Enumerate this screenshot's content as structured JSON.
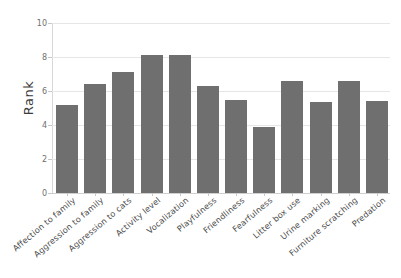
{
  "chart_data": {
    "type": "bar",
    "title": "",
    "xlabel": "",
    "ylabel": "Rank",
    "ylim": [
      0,
      10
    ],
    "yticks": [
      0,
      2,
      4,
      6,
      8,
      10
    ],
    "ytick_labels": [
      "0",
      "2",
      "4",
      "6",
      "8",
      "10"
    ],
    "grid": true,
    "legend": "none",
    "bar_color": "#6f6f6f",
    "gridline_color": "#e6e6e6",
    "categories": [
      "Affection to family",
      "Aggression to family",
      "Aggression to cats",
      "Activity level",
      "Vocalization",
      "Playfulness",
      "Friendliness",
      "Fearfulness",
      "Litter box use",
      "Urine marking",
      "Furniture scratching",
      "Predation"
    ],
    "values": [
      5.2,
      6.4,
      7.1,
      8.1,
      8.1,
      6.3,
      5.5,
      3.9,
      6.6,
      5.35,
      6.6,
      5.4
    ]
  }
}
